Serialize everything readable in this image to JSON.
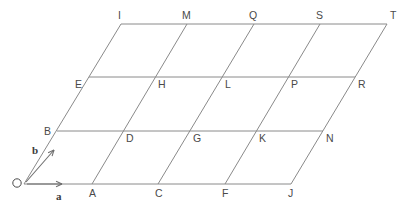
{
  "diagram": {
    "type": "bravais-lattice-2d",
    "background_color": "#ffffff",
    "line_color": "#8a8a8a",
    "label_color": "#4a4a4a",
    "origin": {
      "name": "O",
      "x": 24,
      "y": 184
    },
    "basis_vectors": [
      {
        "name": "a",
        "label": "a",
        "from_x": 27,
        "from_y": 184,
        "to_x": 62,
        "to_y": 184,
        "label_x": 56,
        "label_y": 191
      },
      {
        "name": "b",
        "label": "b",
        "from_x": 26,
        "from_y": 182,
        "to_x": 54,
        "to_y": 150,
        "label_x": 32,
        "label_y": 145
      }
    ],
    "grid": {
      "columns": 5,
      "rows": 4,
      "step_x": 66.5,
      "row_rise": 53.5,
      "row_shift": 32.5,
      "origin_x": 24,
      "origin_y": 184
    },
    "nodes": [
      {
        "label": "O",
        "row": 0,
        "col": 0,
        "x": 24,
        "y": 184,
        "label_x": 13,
        "label_y": 178,
        "hidden": true
      },
      {
        "label": "A",
        "row": 0,
        "col": 1,
        "x": 92,
        "y": 184,
        "label_x": 89,
        "label_y": 188
      },
      {
        "label": "C",
        "row": 0,
        "col": 2,
        "x": 158,
        "y": 184,
        "label_x": 155,
        "label_y": 188
      },
      {
        "label": "F",
        "row": 0,
        "col": 3,
        "x": 225,
        "y": 184,
        "label_x": 222,
        "label_y": 188
      },
      {
        "label": "J",
        "row": 0,
        "col": 4,
        "x": 291,
        "y": 184,
        "label_x": 288,
        "label_y": 188
      },
      {
        "label": "B",
        "row": 1,
        "col": 0,
        "x": 57,
        "y": 131,
        "label_x": 44,
        "label_y": 126
      },
      {
        "label": "D",
        "row": 1,
        "col": 1,
        "x": 123,
        "y": 131,
        "label_x": 126,
        "label_y": 133
      },
      {
        "label": "G",
        "row": 1,
        "col": 2,
        "x": 190,
        "y": 131,
        "label_x": 193,
        "label_y": 133
      },
      {
        "label": "K",
        "row": 1,
        "col": 3,
        "x": 256,
        "y": 131,
        "label_x": 259,
        "label_y": 133
      },
      {
        "label": "N",
        "row": 1,
        "col": 4,
        "x": 323,
        "y": 131,
        "label_x": 326,
        "label_y": 133
      },
      {
        "label": "E",
        "row": 2,
        "col": 0,
        "x": 89,
        "y": 77,
        "label_x": 75,
        "label_y": 79
      },
      {
        "label": "H",
        "row": 2,
        "col": 1,
        "x": 155,
        "y": 77,
        "label_x": 158,
        "label_y": 79
      },
      {
        "label": "L",
        "row": 2,
        "col": 2,
        "x": 222,
        "y": 77,
        "label_x": 225,
        "label_y": 79
      },
      {
        "label": "P",
        "row": 2,
        "col": 3,
        "x": 288,
        "y": 77,
        "label_x": 291,
        "label_y": 79
      },
      {
        "label": "R",
        "row": 2,
        "col": 4,
        "x": 355,
        "y": 77,
        "label_x": 358,
        "label_y": 79
      },
      {
        "label": "I",
        "row": 3,
        "col": 0,
        "x": 121,
        "y": 24,
        "label_x": 118,
        "label_y": 10
      },
      {
        "label": "M",
        "row": 3,
        "col": 1,
        "x": 187,
        "y": 24,
        "label_x": 182,
        "label_y": 10
      },
      {
        "label": "Q",
        "row": 3,
        "col": 2,
        "x": 254,
        "y": 24,
        "label_x": 249,
        "label_y": 10
      },
      {
        "label": "S",
        "row": 3,
        "col": 3,
        "x": 320,
        "y": 24,
        "label_x": 316,
        "label_y": 10
      },
      {
        "label": "T",
        "row": 3,
        "col": 4,
        "x": 387,
        "y": 24,
        "label_x": 390,
        "label_y": 10
      }
    ],
    "horizontal_lines": [
      {
        "name": "row-0",
        "x1": 24,
        "y1": 184,
        "x2": 291,
        "y2": 184
      },
      {
        "name": "row-1",
        "x1": 57,
        "y1": 131,
        "x2": 323,
        "y2": 131
      },
      {
        "name": "row-2",
        "x1": 89,
        "y1": 77,
        "x2": 355,
        "y2": 77
      },
      {
        "name": "row-3",
        "x1": 121,
        "y1": 24,
        "x2": 387,
        "y2": 24
      }
    ],
    "diagonal_lines": [
      {
        "name": "col-0",
        "x1": 24,
        "y1": 184,
        "x2": 121,
        "y2": 24
      },
      {
        "name": "col-1",
        "x1": 92,
        "y1": 184,
        "x2": 187,
        "y2": 24
      },
      {
        "name": "col-2",
        "x1": 158,
        "y1": 184,
        "x2": 254,
        "y2": 24
      },
      {
        "name": "col-3",
        "x1": 225,
        "y1": 184,
        "x2": 320,
        "y2": 24
      },
      {
        "name": "col-4",
        "x1": 291,
        "y1": 184,
        "x2": 387,
        "y2": 24
      }
    ]
  }
}
